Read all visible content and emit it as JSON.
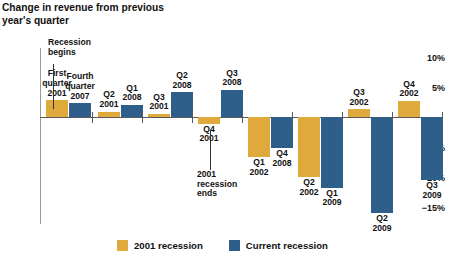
{
  "title": "Change in revenue from\nprevious year's quarter",
  "colors": {
    "recession_2001": "#e0a93b",
    "recession_current": "#2d5f8a",
    "axis": "#5a5a5a"
  },
  "y_axis": {
    "ticks": [
      "10%",
      "5%",
      "−5%",
      "−10%",
      "−15%"
    ],
    "tick_values": [
      10,
      5,
      -5,
      -10,
      -15
    ]
  },
  "annotations": {
    "recession_begins": "Recession\nbegins",
    "recession_ends": "2001\nrecession\nends"
  },
  "legend": {
    "items": [
      {
        "label": "2001 recession",
        "color": "#e0a93b"
      },
      {
        "label": "Current recession",
        "color": "#2d5f8a"
      }
    ]
  },
  "chart_data": {
    "type": "bar",
    "title": "Change in revenue from previous year's quarter",
    "xlabel": "",
    "ylabel": "Change in revenue from previous year's quarter",
    "ylim": [
      -17,
      11
    ],
    "grid": false,
    "legend_position": "bottom-center",
    "categories": [
      "1",
      "2",
      "3",
      "4",
      "5",
      "6",
      "7",
      "8"
    ],
    "series": [
      {
        "name": "2001 recession",
        "color": "#e0a93b",
        "points": [
          {
            "label": "First\nquarter\n2001",
            "value": 2.8
          },
          {
            "label": "Q2\n2001",
            "value": 0.9
          },
          {
            "label": "Q3\n2001",
            "value": 0.5
          },
          {
            "label": "Q4\n2001",
            "value": -1.1
          },
          {
            "label": "Q1\n2002",
            "value": -6.7
          },
          {
            "label": "Q2\n2002",
            "value": -10.0
          },
          {
            "label": "Q3\n2002",
            "value": 1.3
          },
          {
            "label": "Q4\n2002",
            "value": 2.7
          }
        ]
      },
      {
        "name": "Current recession",
        "color": "#2d5f8a",
        "points": [
          {
            "label": "Fourth\nquarter\n2007",
            "value": 2.3
          },
          {
            "label": "Q1\n2008",
            "value": 2.0
          },
          {
            "label": "Q2\n2008",
            "value": 4.1
          },
          {
            "label": "Q3\n2008",
            "value": 4.5
          },
          {
            "label": "Q4\n2008",
            "value": -5.2
          },
          {
            "label": "Q1\n2009",
            "value": -11.8
          },
          {
            "label": "Q2\n2009",
            "value": -16.0
          },
          {
            "label": "Q3\n2009",
            "value": -10.5
          }
        ]
      }
    ]
  }
}
